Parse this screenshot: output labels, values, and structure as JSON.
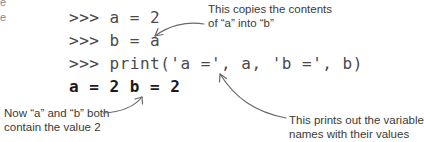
{
  "code": {
    "prompt": ">>>",
    "lines": [
      {
        "prompt": ">>>",
        "text": "a = 2"
      },
      {
        "prompt": ">>>",
        "text": "b = a"
      },
      {
        "prompt": ">>>",
        "text": "print('a =', a, 'b =', b)"
      }
    ],
    "output": "a = 2 b = 2"
  },
  "annotations": {
    "copies": {
      "line1": "This copies the contents",
      "line2": "of “a” into “b”"
    },
    "prints": {
      "line1": "This prints out the variable",
      "line2": "names with their values"
    },
    "both": {
      "line1": "Now “a” and “b” both",
      "line2": "contain the value 2"
    }
  },
  "colors": {
    "code_text": "#4a4a4a",
    "output_text": "#1a1a1a",
    "annotation_text": "#3a3a3a",
    "arrow": "#6a6a6a",
    "background": "#ffffff"
  }
}
